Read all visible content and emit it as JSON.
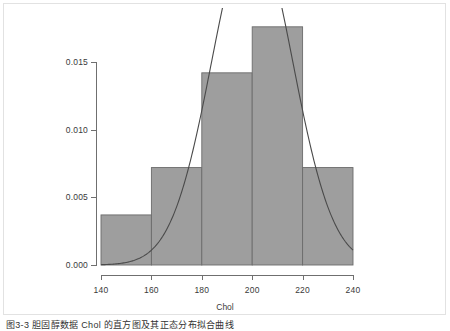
{
  "chart_data": {
    "type": "bar",
    "title": "",
    "subtitle": "",
    "xlabel": "Chol",
    "ylabel": "",
    "xlim": [
      140,
      240
    ],
    "ylim": [
      0.0,
      0.0176
    ],
    "grid": false,
    "legend": "none",
    "bin_width": 20,
    "bin_edges": [
      140,
      160,
      180,
      200,
      220,
      240
    ],
    "categories": [
      "140-160",
      "160-180",
      "180-200",
      "200-220",
      "220-240"
    ],
    "values": [
      0.0037,
      0.0072,
      0.0142,
      0.0176,
      0.0072
    ],
    "x_ticks": [
      "140",
      "160",
      "180",
      "200",
      "220",
      "240"
    ],
    "x_tick_values": [
      140,
      160,
      180,
      200,
      220,
      240
    ],
    "y_ticks": [
      "0.000",
      "0.005",
      "0.010",
      "0.015"
    ],
    "y_tick_values": [
      0.0,
      0.005,
      0.01,
      0.015
    ],
    "bar_fill_color": "#9e9e9e",
    "bar_edge_color": "#6b6b6b",
    "overlay": {
      "name": "normal-density-curve",
      "type": "line",
      "color": "#4a4a4a",
      "description": "fitted normal density curve, peak clipped above plot area",
      "mean": 200,
      "sd": 16,
      "peak_value": 0.0249,
      "x_start": 140,
      "x_end": 240,
      "y_at_start": 0.0002,
      "y_at_end": 0.0021
    },
    "annotations": []
  },
  "axis": {
    "x_title": "Chol"
  },
  "caption": {
    "text": "图3-3  胆固醇数据 Chol 的直方图及其正态分布拟合曲线"
  },
  "colors": {
    "panel_background": "#ffffff",
    "panel_border": "#e2e2e2",
    "axis": "#6f6f6f",
    "text": "#3a3a3a",
    "bar_fill": "#9e9e9e",
    "bar_edge": "#6b6b6b",
    "curve": "#4a4a4a"
  }
}
